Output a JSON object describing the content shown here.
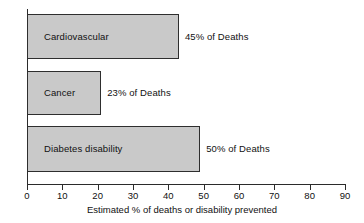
{
  "chart_data": {
    "type": "bar",
    "orientation": "horizontal",
    "title": "",
    "subtitle": "",
    "xlabel": "Estimated % of deaths or disability prevented",
    "ylabel": "",
    "xlim": [
      0,
      90
    ],
    "xticks": [
      0,
      10,
      20,
      30,
      40,
      50,
      60,
      70,
      80,
      90
    ],
    "xtick_labels": [
      "0",
      "10",
      "20",
      "30",
      "40",
      "50",
      "60",
      "70",
      "80",
      "90"
    ],
    "grid": false,
    "legend": false,
    "legend_position": "none",
    "categories": [
      "Cardiovascular",
      "Cancer",
      "Diabetes disability"
    ],
    "values": [
      43,
      21,
      49
    ],
    "data_labels": [
      "45% of Deaths",
      "23% of Deaths",
      "50% of Deaths"
    ],
    "bars": [
      {
        "category": "Cardiovascular",
        "value": 43,
        "data_label": "45% of Deaths",
        "percent_text": "45%",
        "fill_color": "#c9c9c9",
        "border_color": "#2e2e2e"
      },
      {
        "category": "Cancer",
        "value": 21,
        "data_label": "23% of Deaths",
        "percent_text": "23%",
        "fill_color": "#c9c9c9",
        "border_color": "#2e2e2e"
      },
      {
        "category": "Diabetes disability",
        "value": 49,
        "data_label": "50% of Deaths",
        "percent_text": "50%",
        "fill_color": "#c9c9c9",
        "border_color": "#2e2e2e"
      }
    ],
    "colors": {
      "bar_fill": "#c9c9c9",
      "bar_border": "#2e2e2e",
      "axis": "#2b2b2b",
      "text": "#111111",
      "background": "#ffffff"
    }
  }
}
